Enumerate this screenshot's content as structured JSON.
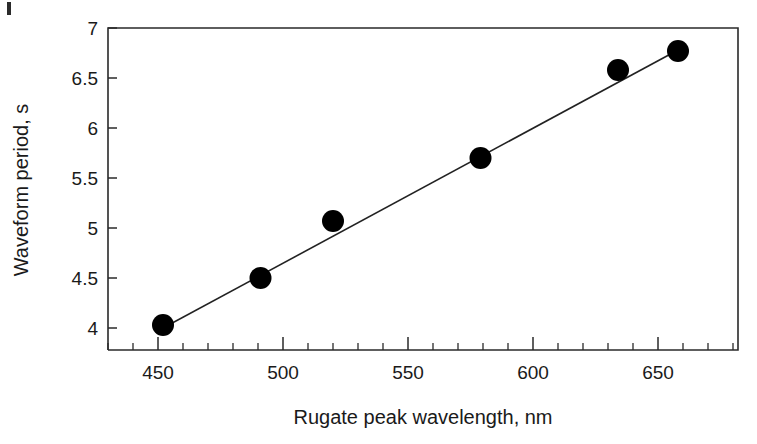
{
  "chart_data": {
    "type": "scatter",
    "title": "",
    "subtitle": "",
    "xlabel": "Rugate peak wavelength, nm",
    "ylabel": "Waveform period, s",
    "xlim": [
      430,
      682
    ],
    "ylim": [
      3.78,
      7.0
    ],
    "grid": false,
    "legend": null,
    "x_ticks_major": [
      450,
      500,
      550,
      600,
      650
    ],
    "x_tick_labels": [
      "450",
      "500",
      "550",
      "600",
      "650"
    ],
    "x_tick_minor_step": 10,
    "y_ticks_major": [
      4,
      4.5,
      5,
      5.5,
      6,
      6.5,
      7
    ],
    "y_tick_labels": [
      "4",
      "4.5",
      "5",
      "5.5",
      "6",
      "6.5",
      "7"
    ],
    "marker": {
      "shape": "circle",
      "color": "#000000",
      "radius_px": 11
    },
    "series": [
      {
        "name": "Waveform period vs rugate peak wavelength",
        "x": [
          452,
          491,
          520,
          579,
          634,
          658
        ],
        "y": [
          4.03,
          4.5,
          5.07,
          5.7,
          6.58,
          6.77
        ]
      }
    ],
    "fit_line": {
      "name": "linear fit",
      "color": "#222222",
      "x": [
        452,
        658
      ],
      "y": [
        4.0,
        6.78
      ]
    },
    "axis_color": "#2a2a2a",
    "background": "#ffffff"
  },
  "figure": {
    "frame_sides": "top-left-right-bottom"
  }
}
